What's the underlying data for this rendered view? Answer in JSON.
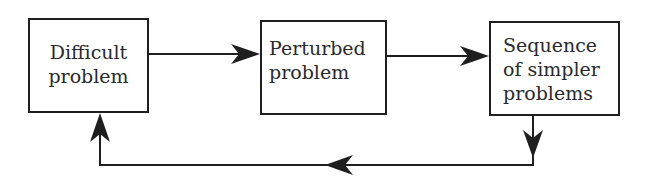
{
  "diagram": {
    "nodes": [
      {
        "id": "difficult",
        "lines": [
          "Difficult",
          "problem"
        ]
      },
      {
        "id": "perturbed",
        "lines": [
          "Perturbed",
          "problem"
        ]
      },
      {
        "id": "sequence",
        "lines": [
          "Sequence",
          "of simpler",
          "problems"
        ]
      }
    ],
    "edges": [
      {
        "from": "difficult",
        "to": "perturbed",
        "direction": "right"
      },
      {
        "from": "perturbed",
        "to": "sequence",
        "direction": "right"
      },
      {
        "from": "sequence",
        "to": "difficult",
        "direction": "feedback-loop",
        "path": [
          "down",
          "left",
          "up"
        ]
      }
    ],
    "colors": {
      "stroke": "#1f1f1f",
      "text": "#2a2a2a",
      "background": "#ffffff"
    }
  }
}
